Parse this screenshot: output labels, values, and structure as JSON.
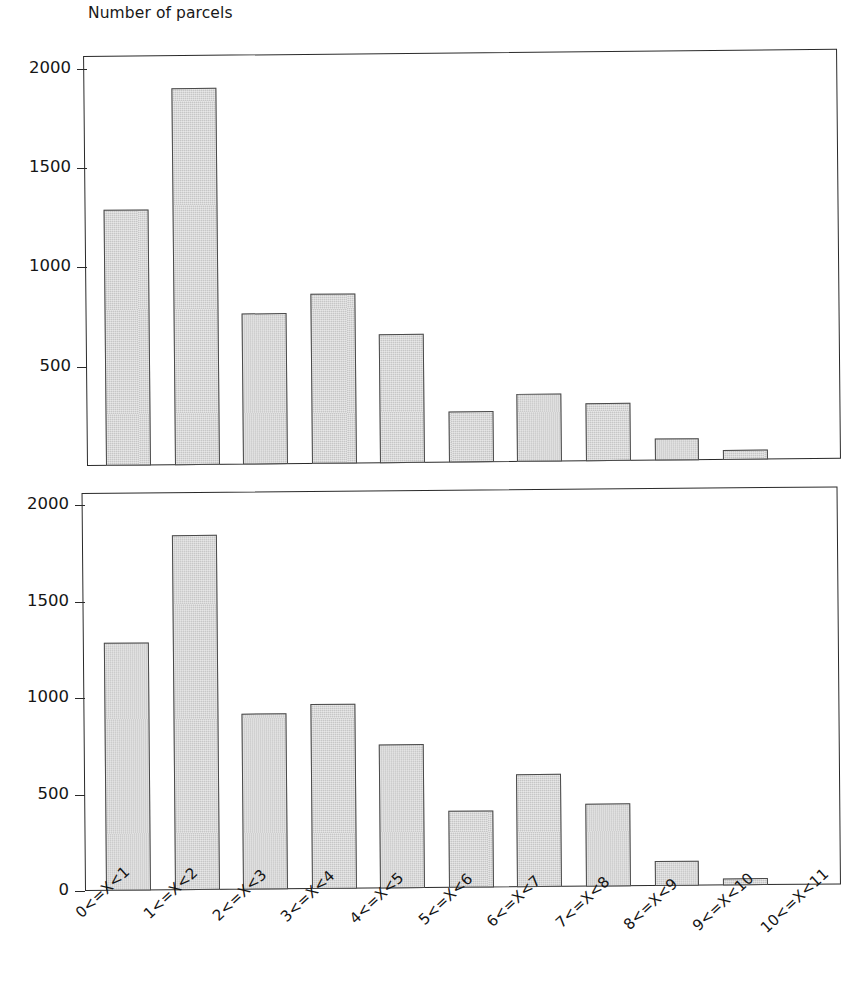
{
  "figure": {
    "title": "Number of parcels",
    "bar_fill_color": "#c6c6c6",
    "bar_edge_color": "#4a4a4a",
    "axis_color": "#2a2a2a",
    "background_color": "#ffffff"
  },
  "chart_data": [
    {
      "type": "bar",
      "panel": "top",
      "title": "Number of parcels",
      "xlabel": "",
      "ylabel": "Number of parcels",
      "ylim": [
        0,
        2100
      ],
      "grid": false,
      "legend": null,
      "yticks": [
        2000,
        1500,
        1000,
        500
      ],
      "ytick_labels": [
        "2000",
        "1500",
        "1000",
        "500"
      ],
      "categories": [
        "0<=X<1",
        "1<=X<2",
        "2<=X<3",
        "3<=X<4",
        "4<=X<5",
        "5<=X<6",
        "6<=X<7",
        "7<=X<8",
        "8<=X<9",
        "9<=X<10",
        "10<=X<11"
      ],
      "values": [
        1310,
        1930,
        775,
        870,
        660,
        260,
        350,
        295,
        115,
        50,
        0
      ]
    },
    {
      "type": "bar",
      "panel": "bottom",
      "title": "",
      "xlabel": "",
      "ylabel": "Number of parcels",
      "ylim": [
        0,
        2100
      ],
      "grid": false,
      "legend": null,
      "yticks": [
        2000,
        1500,
        1000,
        500,
        0
      ],
      "ytick_labels": [
        "2000",
        "1500",
        "1000",
        "500",
        "0"
      ],
      "categories": [
        "0<=X<1",
        "1<=X<2",
        "2<=X<3",
        "3<=X<4",
        "4<=X<5",
        "5<=X<6",
        "6<=X<7",
        "7<=X<8",
        "8<=X<9",
        "9<=X<10",
        "10<=X<11"
      ],
      "values": [
        1310,
        1875,
        930,
        975,
        760,
        405,
        595,
        440,
        130,
        35,
        0
      ]
    }
  ]
}
